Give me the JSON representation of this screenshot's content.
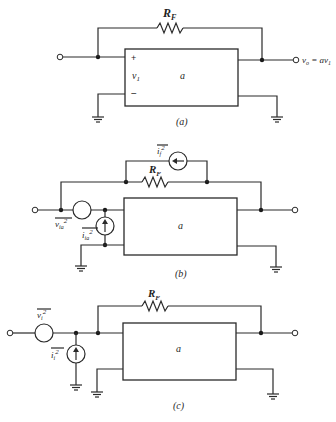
{
  "figure": {
    "panel_a": {
      "caption": "(a)",
      "feedback_resistor": "R",
      "feedback_resistor_sub": "F",
      "amplifier_gain": "a",
      "plus_sign": "+",
      "minus_sign": "−",
      "input_voltage": "v",
      "input_voltage_sub": "1",
      "output_label": "v",
      "output_label_sub": "o",
      "output_eq": " = av",
      "output_eq_sub": "1"
    },
    "panel_b": {
      "caption": "(b)",
      "feedback_resistor": "R",
      "feedback_resistor_sub": "F",
      "amplifier_gain": "a",
      "feedback_noise_current": "i",
      "feedback_noise_current_sub": "f",
      "noise_voltage": "v",
      "noise_voltage_sub": "ia",
      "noise_current": "i",
      "noise_current_sub": "ia",
      "squared": "2"
    },
    "panel_c": {
      "caption": "(c)",
      "feedback_resistor": "R",
      "feedback_resistor_sub": "F",
      "amplifier_gain": "a",
      "equiv_noise_voltage": "v",
      "equiv_noise_voltage_sub": "i",
      "equiv_noise_current": "i",
      "equiv_noise_current_sub": "i",
      "squared": "2"
    }
  }
}
